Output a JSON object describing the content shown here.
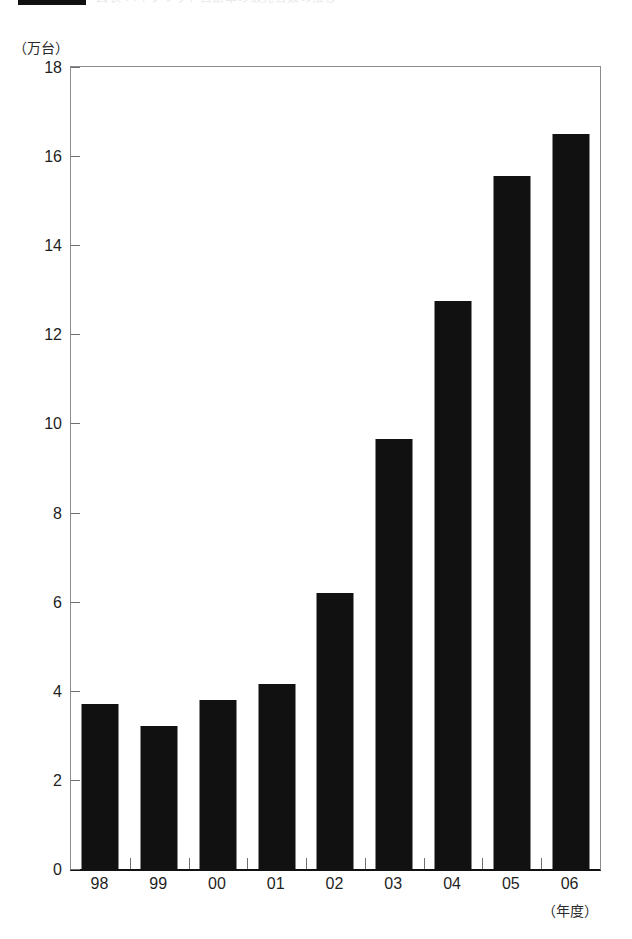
{
  "header": {
    "rule_icon": "black-bar-marker",
    "title": "図表 ハイブリッド自動車の販売台数の推移"
  },
  "chart_data": {
    "type": "bar",
    "title": "",
    "subtitle": "",
    "unit_label": "（万台）",
    "xlabel": "（年度）",
    "ylabel": "",
    "categories": [
      "98",
      "99",
      "00",
      "01",
      "02",
      "03",
      "04",
      "05",
      "06"
    ],
    "values": [
      3.7,
      3.2,
      3.8,
      4.15,
      6.2,
      9.65,
      12.75,
      15.55,
      16.5
    ],
    "ylim": [
      0,
      18
    ],
    "ytick_step": 2,
    "ytick_labels": [
      "0",
      "2",
      "4",
      "6",
      "8",
      "10",
      "12",
      "14",
      "16",
      "18"
    ],
    "grid": false,
    "legend": null,
    "bar_color": "#111111",
    "axis_color": "#8c8c92",
    "baseline_color": "#111111"
  }
}
